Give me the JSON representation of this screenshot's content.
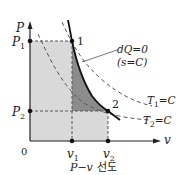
{
  "diagram": {
    "title": "P−v 선도",
    "caption": {
      "math": "P−v",
      "text": "선도"
    },
    "axes": {
      "y_label": "P",
      "x_label": "v",
      "origin_label": "0"
    },
    "ticks": {
      "p1": {
        "label": "P",
        "sub": "1"
      },
      "p2": {
        "label": "P",
        "sub": "2"
      },
      "v1": {
        "label": "v",
        "sub": "1"
      },
      "v2": {
        "label": "v",
        "sub": "2"
      }
    },
    "points": {
      "state1": "1",
      "state2": "2"
    },
    "annotations": {
      "adiabatic_line1": "dQ=0",
      "adiabatic_line2": "(s=C)",
      "isotherm1": {
        "label": "T",
        "sub": "1",
        "rest": "=C"
      },
      "isotherm2": {
        "label": "T",
        "sub": "2",
        "rest": "=C"
      }
    },
    "colors": {
      "light_fill": "#d9d9d9",
      "dark_fill": "#8c8c8c",
      "line": "#222222",
      "dash": "#555555"
    }
  }
}
